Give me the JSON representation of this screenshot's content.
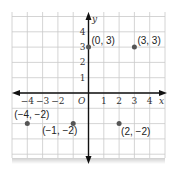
{
  "chart_data": {
    "type": "scatter",
    "title": "",
    "xlabel": "x",
    "ylabel": "y",
    "origin_label": "O",
    "xlim": [
      -5,
      5
    ],
    "ylim": [
      -4.3,
      5.2
    ],
    "grid": true,
    "x_ticks": [
      -4,
      -3,
      -2,
      1,
      2,
      3,
      4
    ],
    "y_ticks": [
      1,
      2,
      3,
      4
    ],
    "points": [
      {
        "x": 0,
        "y": 3,
        "label": "(0, 3)"
      },
      {
        "x": 3,
        "y": 3,
        "label": "(3, 3)"
      },
      {
        "x": -4,
        "y": -2,
        "label": "(−4, −2)"
      },
      {
        "x": -1,
        "y": -2,
        "label": "(−1, −2)"
      },
      {
        "x": 2,
        "y": -2,
        "label": "(2, −2)"
      }
    ]
  },
  "tick_labels": {
    "x": [
      "−4",
      "−3",
      "−2",
      "1",
      "2",
      "3",
      "4"
    ],
    "y": [
      "1",
      "2",
      "3",
      "4"
    ],
    "origin": "O",
    "x_axis": "x",
    "y_axis": "y"
  },
  "colors": {
    "grid": "#c9c9c9",
    "axis": "#111111",
    "point": "#555555",
    "text": "#222222"
  }
}
